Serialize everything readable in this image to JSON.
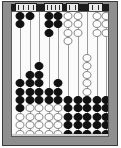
{
  "figure": {
    "type": "abacus-diagram",
    "colors": {
      "frame": "#8f8f8f",
      "beam": "#1c1c1c",
      "board": "#fbfbfb",
      "bead_on": "#111111",
      "bead_off": "#fdfdfd",
      "bead_off_outline": "#8a8a8a",
      "rod": "#9a9a9a",
      "outline": "#3a3a3a"
    },
    "geometry": {
      "board_left": 11,
      "board_top": 11,
      "board_width": 98,
      "board_height": 126,
      "rod_count": 10,
      "rod_spacing": 9.6,
      "rod_first_x": 8,
      "bead_pitch": 8.4,
      "bead_width": 9,
      "bead_height": 8
    }
  },
  "plaques": [
    {
      "name": "plaque-1",
      "left": 15,
      "width": 22,
      "ticks": 4
    },
    {
      "name": "plaque-2",
      "left": 44,
      "width": 19,
      "ticks": 4
    },
    {
      "name": "plaque-3",
      "left": 66,
      "width": 13,
      "ticks": 2
    },
    {
      "name": "plaque-4",
      "left": 88,
      "width": 15,
      "ticks": 2
    }
  ],
  "rods": [
    {
      "index": 1,
      "label": "rod-1",
      "beads_on_top": 2,
      "top_group_start": 0,
      "beads_on_bottom": 4,
      "bottom_group_start": 8,
      "beads_off": 4,
      "off_group_start": 12
    },
    {
      "index": 2,
      "label": "rod-2",
      "beads_on_top": 1,
      "top_group_start": 0,
      "beads_on_bottom": 4,
      "bottom_group_start": 7,
      "beads_off": 5,
      "off_group_start": 11
    },
    {
      "index": 3,
      "label": "rod-3",
      "beads_on_top": 0,
      "top_group_start": 0,
      "beads_on_bottom": 5,
      "bottom_group_start": 6,
      "beads_off": 5,
      "off_group_start": 11
    },
    {
      "index": 4,
      "label": "rod-4",
      "beads_on_top": 3,
      "top_group_start": 0,
      "beads_on_bottom": 2,
      "bottom_group_start": 9,
      "beads_off": 4,
      "off_group_start": 11
    },
    {
      "index": 5,
      "label": "rod-5",
      "beads_on_top": 2,
      "top_group_start": 0,
      "beads_on_bottom": 3,
      "bottom_group_start": 8,
      "beads_off": 4,
      "off_group_start": 11
    },
    {
      "index": 6,
      "label": "rod-6",
      "beads_on_top": 0,
      "top_group_start": 0,
      "beads_on_bottom": 5,
      "bottom_group_start": 10,
      "beads_off": 4,
      "off_group_start": 0
    },
    {
      "index": 7,
      "label": "rod-7",
      "beads_on_top": 0,
      "top_group_start": 0,
      "beads_on_bottom": 5,
      "bottom_group_start": 10,
      "beads_off": 3,
      "off_group_start": 0
    },
    {
      "index": 8,
      "label": "rod-8",
      "beads_on_top": 0,
      "top_group_start": 0,
      "beads_on_bottom": 5,
      "bottom_group_start": 10,
      "beads_off": 5,
      "off_group_start": 5
    },
    {
      "index": 9,
      "label": "rod-9",
      "beads_on_top": 0,
      "top_group_start": 0,
      "beads_on_bottom": 5,
      "bottom_group_start": 10,
      "beads_off": 3,
      "off_group_start": 0
    },
    {
      "index": 10,
      "label": "rod-10",
      "beads_on_top": 0,
      "top_group_start": 0,
      "beads_on_bottom": 5,
      "bottom_group_start": 10,
      "beads_off": 3,
      "off_group_start": 0
    }
  ]
}
